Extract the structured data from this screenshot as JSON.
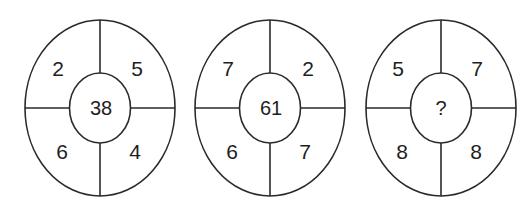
{
  "puzzle": {
    "type": "number-circle-puzzle",
    "figures": [
      {
        "top_left": "2",
        "top_right": "5",
        "bottom_left": "6",
        "bottom_right": "4",
        "center": "38"
      },
      {
        "top_left": "7",
        "top_right": "2",
        "bottom_left": "6",
        "bottom_right": "7",
        "center": "61"
      },
      {
        "top_left": "5",
        "top_right": "7",
        "bottom_left": "8",
        "bottom_right": "8",
        "center": "?"
      }
    ],
    "colors": {
      "line": "#2a2a2a",
      "text": "#1e1e1e",
      "background": "#ffffff"
    }
  }
}
